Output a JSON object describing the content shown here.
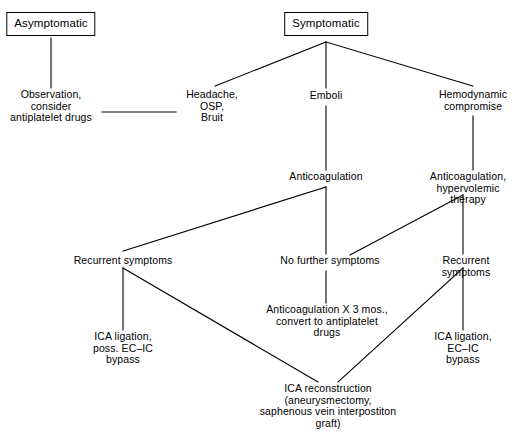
{
  "diagram": {
    "background_color": "#ffffff",
    "line_color": "#000000",
    "text_color": "#000000",
    "nodes": {
      "asymptomatic": "Asymptomatic",
      "symptomatic": "Symptomatic",
      "observation": "Observation,\nconsider\nantiplatelet drugs",
      "headache": "Headache,\nOSP,\nBruit",
      "emboli": "Emboli",
      "hemodynamic": "Hemodynamic\ncompromise",
      "anticoagulation": "Anticoagulation",
      "anticoagulation_hypervolemic": "Anticoagulation,\nhypervolemic therapy",
      "recurrent_left": "Recurrent symptoms",
      "no_further": "No further symptoms",
      "recurrent_right": "Recurrent symptoms",
      "ica_ligation_poss": "ICA ligation,\nposs. EC–IC\nbypass",
      "anticoag_3mos": "Anticoagulation X 3 mos.,\nconvert to antiplatelet\ndrugs",
      "ica_ligation_ecic": "ICA ligation,\nEC–IC bypass",
      "ica_reconstruction": "ICA reconstruction\n(aneurysmectomy,\nsaphenous vein interpostiton\ngraft)"
    },
    "edges": [
      {
        "from": "asymptomatic",
        "to": "observation"
      },
      {
        "from": "observation",
        "to": "headache"
      },
      {
        "from": "symptomatic",
        "to": "headache"
      },
      {
        "from": "symptomatic",
        "to": "emboli"
      },
      {
        "from": "symptomatic",
        "to": "hemodynamic"
      },
      {
        "from": "emboli",
        "to": "anticoagulation"
      },
      {
        "from": "hemodynamic",
        "to": "anticoagulation_hypervolemic"
      },
      {
        "from": "anticoagulation",
        "to": "recurrent_left"
      },
      {
        "from": "anticoagulation",
        "to": "no_further"
      },
      {
        "from": "anticoagulation_hypervolemic",
        "to": "no_further"
      },
      {
        "from": "anticoagulation_hypervolemic",
        "to": "recurrent_right"
      },
      {
        "from": "recurrent_left",
        "to": "ica_ligation_poss"
      },
      {
        "from": "recurrent_left",
        "to": "ica_reconstruction"
      },
      {
        "from": "no_further",
        "to": "anticoag_3mos"
      },
      {
        "from": "recurrent_right",
        "to": "ica_ligation_ecic"
      },
      {
        "from": "recurrent_right",
        "to": "ica_reconstruction"
      }
    ]
  }
}
